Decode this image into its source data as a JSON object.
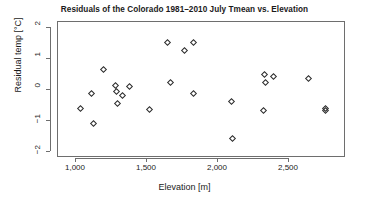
{
  "chart_data": {
    "type": "scatter",
    "title": "Residuals of the Colorado 1981–2010 July Tmean vs. Elevation",
    "xlabel": "Elevation [m]",
    "ylabel": "Residual temp [°C]",
    "xlim": [
      1000,
      2500
    ],
    "ylim": [
      -2,
      2
    ],
    "xticks": [
      1000,
      1500,
      2000,
      2500
    ],
    "xtick_labels": [
      "1,000",
      "1,500",
      "2,000",
      "2,500"
    ],
    "yticks": [
      2,
      1,
      0,
      -1,
      -2
    ],
    "ytick_labels": [
      "2",
      "1",
      "0",
      "−1",
      "−2"
    ],
    "grid": false,
    "legend": null,
    "marker": "diamond-open",
    "marker_color": "#2b2b2b",
    "points": [
      {
        "x": 1035,
        "y": -0.61
      },
      {
        "x": 1110,
        "y": -0.12
      },
      {
        "x": 1120,
        "y": -1.08
      },
      {
        "x": 1195,
        "y": 0.65
      },
      {
        "x": 1280,
        "y": 0.13
      },
      {
        "x": 1285,
        "y": -0.06
      },
      {
        "x": 1290,
        "y": -0.45
      },
      {
        "x": 1330,
        "y": -0.18
      },
      {
        "x": 1375,
        "y": 0.11
      },
      {
        "x": 1520,
        "y": -0.63
      },
      {
        "x": 1645,
        "y": 1.54
      },
      {
        "x": 1665,
        "y": 0.25
      },
      {
        "x": 1765,
        "y": 1.27
      },
      {
        "x": 1825,
        "y": 1.53
      },
      {
        "x": 1830,
        "y": -0.1
      },
      {
        "x": 2095,
        "y": -0.38
      },
      {
        "x": 2100,
        "y": -1.55
      },
      {
        "x": 2320,
        "y": -0.67
      },
      {
        "x": 2330,
        "y": 0.51
      },
      {
        "x": 2335,
        "y": 0.25
      },
      {
        "x": 2390,
        "y": 0.43
      },
      {
        "x": 2640,
        "y": 0.38
      },
      {
        "x": 2755,
        "y": -0.61
      },
      {
        "x": 2760,
        "y": -0.66
      }
    ]
  }
}
